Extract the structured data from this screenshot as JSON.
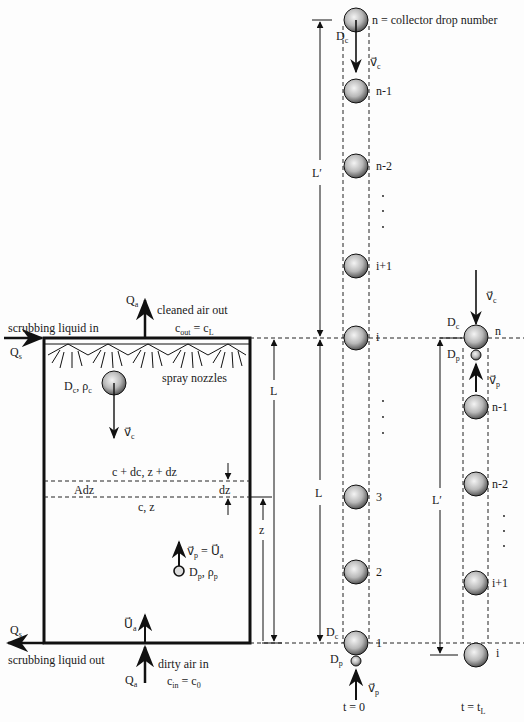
{
  "scrubber": {
    "liquid_in_label": "scrubbing liquid in",
    "liquid_in_flow": "Qs",
    "liquid_out_label": "scrubbing liquid out",
    "liquid_out_flow": "Qs",
    "clean_air_label": "cleaned air out",
    "clean_air_flow": "Qa",
    "c_out_label": "c_out = c_L",
    "dirty_air_label": "dirty air in",
    "dirty_air_flow": "Qa",
    "c_in_label": "c_in = c_0",
    "spray_label": "spray nozzles",
    "nozzle_count": 5,
    "collector_label": "Dc, ρc",
    "collector_velocity": "v⃗c",
    "slice_top_label": "c + dc, z + dz",
    "slice_area_label": "Adz",
    "slice_bottom_label": "c, z",
    "slice_thickness": "dz",
    "particle_velocity": "v⃗p = U⃗a",
    "particle_label": "Dp, ρp",
    "air_velocity": "U⃗a",
    "height_label": "L",
    "z_label": "z"
  },
  "column_t0": {
    "time_label": "t = 0",
    "top_drop_label": "n = collector drop number",
    "drops": [
      "n",
      "n-1",
      "n-2",
      "i+1",
      "i",
      "3",
      "2",
      "1"
    ],
    "Lprime_label": "L′",
    "L_label": "L",
    "Dc_label": "Dc",
    "Dp_label": "Dp",
    "vc_label": "v⃗c",
    "vp_label": "v⃗p"
  },
  "column_tL": {
    "time_label": "t = tL",
    "drops": [
      "n",
      "n-1",
      "n-2",
      "i+1",
      "i"
    ],
    "Lprime_label": "L′",
    "Dc_label": "Dc",
    "Dp_label": "Dp",
    "vc_label": "v⃗c",
    "vp_label": "v⃗p"
  },
  "colors": {
    "ink": "#111111",
    "background": "#fdfdfd",
    "drop_highlight": "#f4f4f4",
    "drop_shadow": "#5a5a5a"
  }
}
